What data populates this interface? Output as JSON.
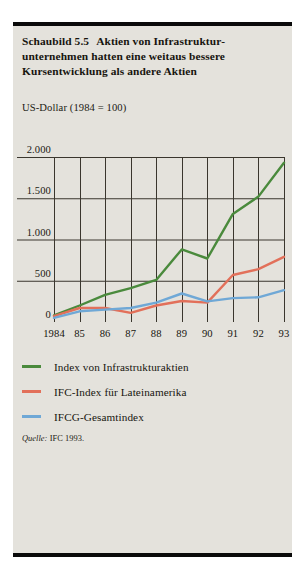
{
  "figure": {
    "title_number": "Schaubild 5.5",
    "title_text": "Aktien von Infrastruktur­unternehmen hatten eine weitaus bessere Kursentwicklung als andere Aktien",
    "unit_label": "US-Dollar (1984 = 100)",
    "source_key": "Quelle:",
    "source_value": "IFC 1993.",
    "background_color": "#e4e2dc",
    "rule_color": "#0a0a0a"
  },
  "legend": {
    "items": [
      {
        "label": "Index von Infrastrukturaktien",
        "color": "#4a8a3c"
      },
      {
        "label": "IFC-Index für Lateinamerika",
        "color": "#e2705a"
      },
      {
        "label": "IFCG-Gesamtindex",
        "color": "#6fa8d6"
      }
    ]
  },
  "chart_data": {
    "type": "line",
    "xlabel": "",
    "ylabel": "US-Dollar (1984 = 100)",
    "categories": [
      "1984",
      "85",
      "86",
      "87",
      "88",
      "89",
      "90",
      "91",
      "92",
      "93"
    ],
    "xtick_labels": [
      "1984",
      "85",
      "86",
      "87",
      "88",
      "89",
      "90",
      "91",
      "92",
      "93"
    ],
    "ytick_labels": [
      "0",
      "500",
      "1.000",
      "1.500",
      "2.000"
    ],
    "ytick_values": [
      0,
      500,
      1000,
      1500,
      2000
    ],
    "ylim": [
      0,
      2000
    ],
    "grid": "both",
    "legend_position": "below",
    "series": [
      {
        "name": "Index von Infrastrukturaktien",
        "color": "#4a8a3c",
        "values": [
          80,
          200,
          330,
          410,
          510,
          880,
          770,
          1310,
          1520,
          1930
        ]
      },
      {
        "name": "IFC-Index für Lateinamerika",
        "color": "#e2705a",
        "values": [
          70,
          170,
          170,
          110,
          200,
          255,
          235,
          570,
          640,
          790
        ]
      },
      {
        "name": "IFCG-Gesamtindex",
        "color": "#6fa8d6",
        "values": [
          50,
          130,
          150,
          170,
          235,
          345,
          250,
          290,
          300,
          385
        ]
      }
    ]
  }
}
